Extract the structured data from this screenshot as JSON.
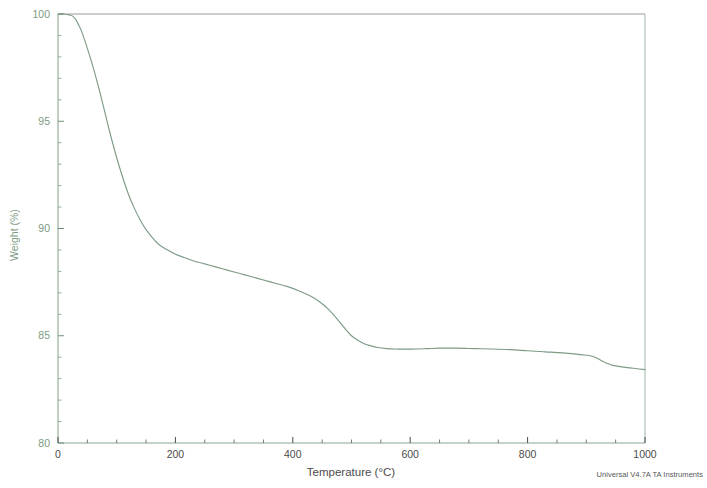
{
  "chart_data": {
    "type": "line",
    "title": "",
    "subtitle": "",
    "xlabel": "Temperature (°C)",
    "ylabel": "Weight (%)",
    "xlim": [
      0,
      1000
    ],
    "ylim": [
      80,
      100
    ],
    "xticks": [
      0,
      200,
      400,
      600,
      800,
      1000
    ],
    "xtick_labels": [
      "0",
      "200",
      "400",
      "600",
      "800",
      "1000"
    ],
    "x_minor_tick_interval": 50,
    "yticks": [
      80,
      85,
      90,
      95,
      100
    ],
    "ytick_labels": [
      "80",
      "85",
      "90",
      "95",
      "100"
    ],
    "y_minor_tick_interval": 1,
    "grid": false,
    "legend": null,
    "legend_position": "none",
    "series": [
      {
        "name": "Weight",
        "color": "#7e9b86",
        "x": [
          0,
          10,
          20,
          25,
          30,
          35,
          40,
          50,
          60,
          70,
          80,
          90,
          100,
          110,
          120,
          130,
          140,
          150,
          160,
          170,
          180,
          190,
          200,
          215,
          230,
          250,
          270,
          290,
          310,
          330,
          350,
          370,
          390,
          410,
          430,
          445,
          460,
          475,
          490,
          500,
          510,
          520,
          530,
          545,
          560,
          575,
          590,
          610,
          630,
          650,
          680,
          710,
          740,
          770,
          800,
          830,
          860,
          890,
          905,
          915,
          925,
          935,
          945,
          960,
          975,
          990,
          1000
        ],
        "y": [
          100.0,
          100.0,
          99.95,
          99.9,
          99.75,
          99.5,
          99.2,
          98.4,
          97.5,
          96.5,
          95.4,
          94.3,
          93.3,
          92.4,
          91.6,
          90.95,
          90.4,
          89.95,
          89.6,
          89.3,
          89.1,
          88.95,
          88.8,
          88.65,
          88.5,
          88.35,
          88.2,
          88.05,
          87.9,
          87.75,
          87.6,
          87.45,
          87.3,
          87.1,
          86.85,
          86.6,
          86.25,
          85.8,
          85.3,
          85.0,
          84.8,
          84.65,
          84.55,
          84.45,
          84.4,
          84.38,
          84.38,
          84.38,
          84.4,
          84.42,
          84.42,
          84.4,
          84.38,
          84.35,
          84.3,
          84.25,
          84.2,
          84.12,
          84.08,
          84.0,
          83.85,
          83.72,
          83.62,
          83.55,
          83.5,
          83.45,
          83.42
        ]
      }
    ],
    "annotations": [],
    "footer_credit": "Universal V4.7A TA Instruments",
    "axis_color": "#8aa890",
    "frame_color": "#9a9a9a",
    "curve_color": "#7e9b86",
    "background_color": "#ffffff"
  }
}
